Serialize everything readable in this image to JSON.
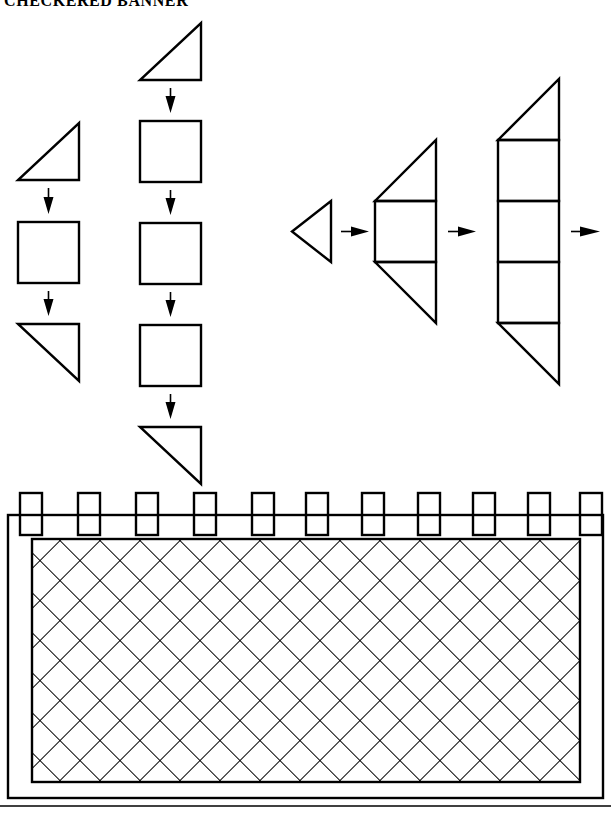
{
  "document": {
    "title": "CHECKERED BANNER",
    "type": "craft-instruction-diagram",
    "page_width": 611,
    "page_height": 822,
    "ink_color": "#000000",
    "paper_color": "#ffffff"
  },
  "diagram": {
    "name": "checkered-banner-assembly",
    "columns": [
      {
        "id": "column-left",
        "label": "left-stack",
        "units": [
          {
            "shape": "triangle",
            "orientation": "hypotenuse-bottom-left-to-top-right",
            "name": "triangle-up"
          },
          {
            "shape": "arrow",
            "direction": "down",
            "name": "arrow-down"
          },
          {
            "shape": "square",
            "name": "square"
          },
          {
            "shape": "arrow",
            "direction": "down",
            "name": "arrow-down"
          },
          {
            "shape": "triangle",
            "orientation": "hypotenuse-top-left-to-bottom-right",
            "name": "triangle-down"
          }
        ],
        "square_count": 1,
        "triangle_count": 2
      },
      {
        "id": "column-middle",
        "label": "middle-stack",
        "units": [
          {
            "shape": "triangle",
            "orientation": "hypotenuse-bottom-left-to-top-right",
            "name": "triangle-up"
          },
          {
            "shape": "arrow",
            "direction": "down",
            "name": "arrow-down"
          },
          {
            "shape": "square",
            "name": "square"
          },
          {
            "shape": "arrow",
            "direction": "down",
            "name": "arrow-down"
          },
          {
            "shape": "square",
            "name": "square"
          },
          {
            "shape": "arrow",
            "direction": "down",
            "name": "arrow-down"
          },
          {
            "shape": "square",
            "name": "square"
          },
          {
            "shape": "arrow",
            "direction": "down",
            "name": "arrow-down"
          },
          {
            "shape": "triangle",
            "orientation": "hypotenuse-top-left-to-bottom-right",
            "name": "triangle-down"
          }
        ],
        "square_count": 3,
        "triangle_count": 2
      }
    ],
    "progression": {
      "id": "assembly-progression",
      "direction": "left-to-right",
      "steps": [
        {
          "index": 1,
          "name": "step-single-triangle",
          "squares": 0,
          "triangles": 1,
          "caption": "single left-pointing triangle"
        },
        {
          "index": 2,
          "name": "step-triangle-square-triangle",
          "squares": 1,
          "triangles": 2,
          "caption": "triangle + square + triangle"
        },
        {
          "index": 3,
          "name": "step-triangle-three-squares-triangle",
          "squares": 3,
          "triangles": 2,
          "caption": "triangle + three squares + triangle"
        }
      ],
      "arrow_count": 3,
      "trailing_arrow": true
    },
    "banner": {
      "id": "finished-banner",
      "name": "checkered-banner-panel",
      "crenellation_count": 11,
      "crenellation_label": "tab",
      "fill_pattern": "diagonal-lattice",
      "pattern_label": "checkered",
      "has_outer_frame": true,
      "has_inner_panel": true,
      "has_baseline_rule": true
    }
  }
}
